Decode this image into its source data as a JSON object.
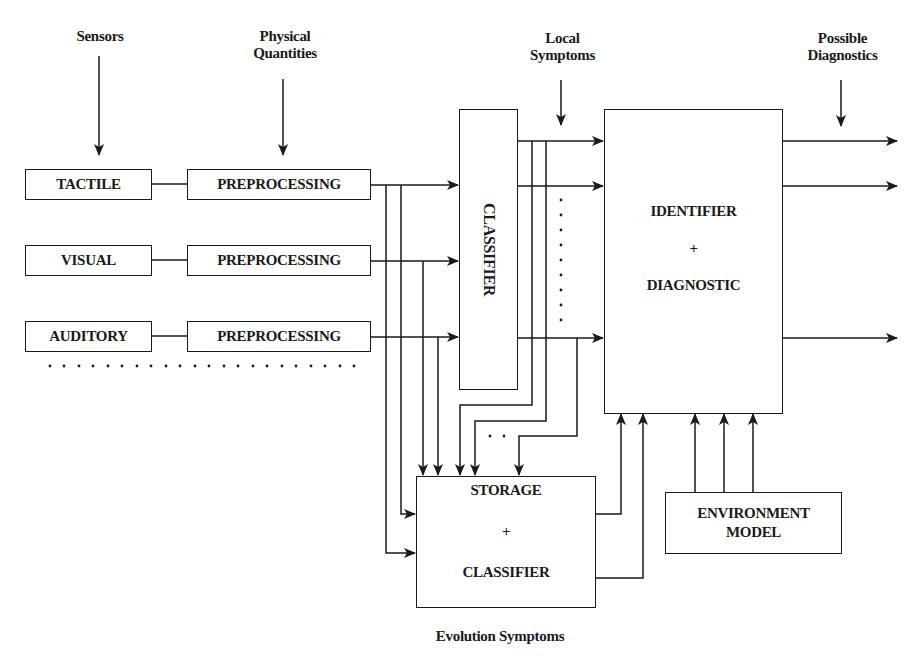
{
  "labels": {
    "sensors": "Sensors",
    "physical_quantities": [
      "Physical",
      "Quantities"
    ],
    "local_symptoms": [
      "Local",
      "Symptoms"
    ],
    "possible_diagnostics": [
      "Possible",
      "Diagnostics"
    ],
    "evolution_symptoms": "Evolution Symptoms"
  },
  "sensors": [
    {
      "label": "TACTILE"
    },
    {
      "label": "VISUAL"
    },
    {
      "label": "AUDITORY"
    }
  ],
  "preprocessing": [
    {
      "label": "PREPROCESSING"
    },
    {
      "label": "PREPROCESSING"
    },
    {
      "label": "PREPROCESSING"
    }
  ],
  "classifier": {
    "label": "CLASSIFIER"
  },
  "identifier": {
    "line1": "IDENTIFIER",
    "plus": "+",
    "line2": "DIAGNOSTIC"
  },
  "storage": {
    "line1": "STORAGE",
    "plus": "+",
    "line2": "CLASSIFIER"
  },
  "environment": {
    "line1": "ENVIRONMENT",
    "line2": "MODEL"
  },
  "colors": {
    "stroke": "#1a1a1a",
    "background": "#ffffff"
  }
}
